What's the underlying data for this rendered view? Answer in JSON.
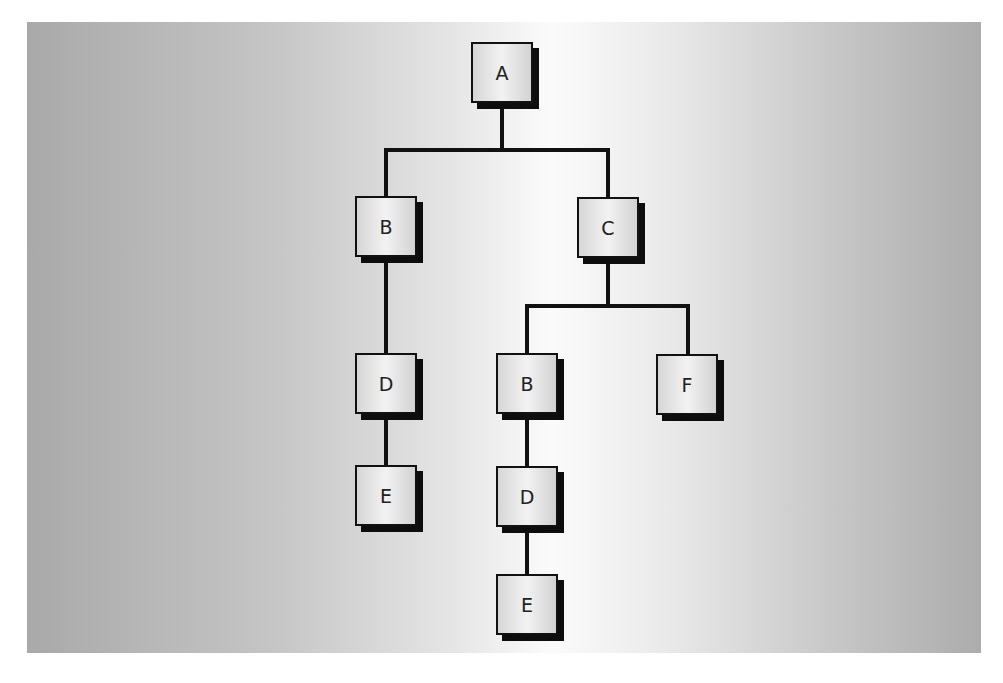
{
  "diagram": {
    "type": "tree",
    "nodes": [
      {
        "id": "n1",
        "label": "A",
        "x": 471,
        "y": 42
      },
      {
        "id": "n2",
        "label": "B",
        "x": 355,
        "y": 196
      },
      {
        "id": "n3",
        "label": "C",
        "x": 577,
        "y": 197
      },
      {
        "id": "n4",
        "label": "D",
        "x": 355,
        "y": 353
      },
      {
        "id": "n5",
        "label": "B",
        "x": 496,
        "y": 353
      },
      {
        "id": "n6",
        "label": "F",
        "x": 656,
        "y": 354
      },
      {
        "id": "n7",
        "label": "E",
        "x": 355,
        "y": 465
      },
      {
        "id": "n8",
        "label": "D",
        "x": 496,
        "y": 466
      },
      {
        "id": "n9",
        "label": "E",
        "x": 496,
        "y": 574
      }
    ],
    "edges": [
      [
        "n1",
        "n2"
      ],
      [
        "n1",
        "n3"
      ],
      [
        "n2",
        "n4"
      ],
      [
        "n4",
        "n7"
      ],
      [
        "n3",
        "n5"
      ],
      [
        "n3",
        "n6"
      ],
      [
        "n5",
        "n8"
      ],
      [
        "n8",
        "n9"
      ]
    ],
    "colors": {
      "line": "#111111",
      "shadow": "#0d0d0d",
      "text": "#222222"
    }
  }
}
